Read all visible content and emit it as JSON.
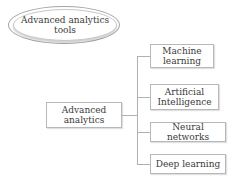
{
  "diagram": {
    "title_node": {
      "label": "Advanced analytics tools",
      "line1": "Advanced analytics",
      "line2": "tools"
    },
    "root_node": {
      "line1": "Advanced",
      "line2": "analytics"
    },
    "children": [
      {
        "line1": "Machine",
        "line2": "learning"
      },
      {
        "line1": "Artificial",
        "line2": "Intelligence"
      },
      {
        "line1": "Neural networks",
        "line2": ""
      },
      {
        "line1": "Deep learning",
        "line2": ""
      }
    ]
  }
}
